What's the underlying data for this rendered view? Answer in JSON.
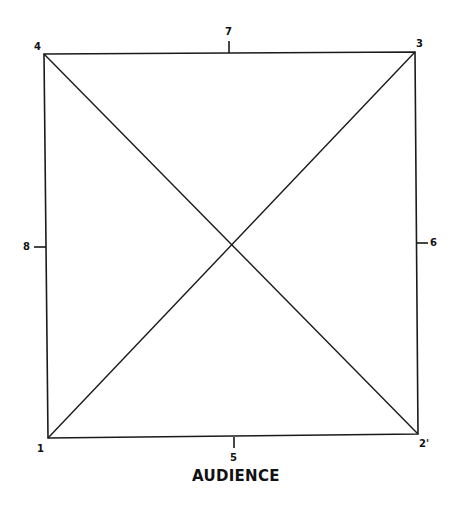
{
  "diagram": {
    "type": "stage-square-with-diagonals",
    "caption": "AUDIENCE",
    "line_color": "#1a1a1a",
    "corners": {
      "1": {
        "label": "1",
        "position": "bottom-left"
      },
      "2": {
        "label": "2'",
        "position": "bottom-right"
      },
      "3": {
        "label": "3",
        "position": "top-right"
      },
      "4": {
        "label": "4",
        "position": "top-left"
      }
    },
    "midpoints": {
      "5": {
        "label": "5",
        "position": "bottom-center"
      },
      "6": {
        "label": "6",
        "position": "right-center"
      },
      "7": {
        "label": "7",
        "position": "top-center"
      },
      "8": {
        "label": "8",
        "position": "left-center"
      }
    }
  }
}
